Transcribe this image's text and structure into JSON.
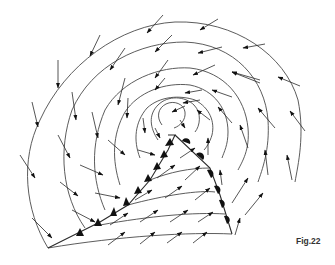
{
  "figure": {
    "caption": "Fig.22",
    "colors": {
      "line": "#4a4a4a",
      "symbol": "#111111",
      "background": "#ffffff"
    }
  },
  "legend_symbols": {
    "cold_front": "triangles",
    "warm_front": "semicircles",
    "isobars": "curved lines",
    "wind": "arrows"
  }
}
